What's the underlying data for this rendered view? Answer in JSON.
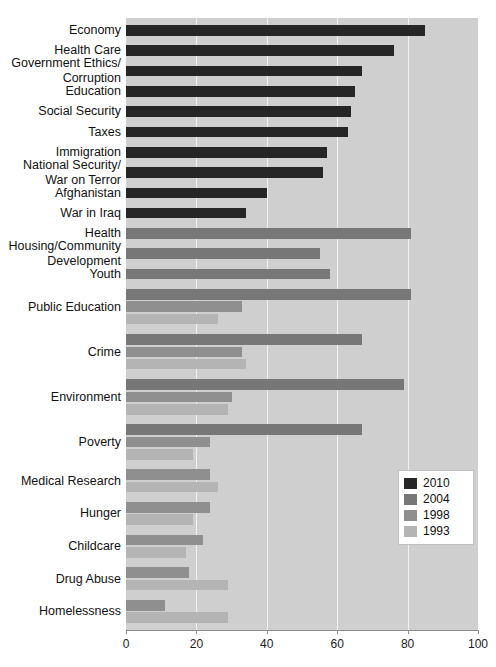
{
  "chart_data": {
    "type": "bar",
    "orientation": "horizontal",
    "title": "",
    "subtitle": "",
    "xlabel": "",
    "ylabel": "",
    "xlim": [
      0,
      100
    ],
    "xticks": [
      0,
      20,
      40,
      60,
      80,
      100
    ],
    "xtick_labels": [
      "0",
      "20",
      "40",
      "60",
      "80",
      "100"
    ],
    "grid": true,
    "grid_axis": "x",
    "legend_position": "center-right",
    "plot_background": "#cfcfcf",
    "series": [
      {
        "name": "2010",
        "color": "#262626"
      },
      {
        "name": "2004",
        "color": "#777777"
      },
      {
        "name": "1998",
        "color": "#8f8f8f"
      },
      {
        "name": "1993",
        "color": "#b4b4b4"
      }
    ],
    "categories": [
      "Economy",
      "Health Care",
      "Government Ethics/\nCorruption",
      "Education",
      "Social Security",
      "Taxes",
      "Immigration",
      "National Security/\nWar on Terror",
      "Afghanistan",
      "War in Iraq",
      "Health",
      "Housing/Community\nDevelopment",
      "Youth",
      "Public Education",
      "Crime",
      "Environment",
      "Poverty",
      "Medical Research",
      "Hunger",
      "Childcare",
      "Drug Abuse",
      "Homelessness"
    ],
    "groups": [
      {
        "category": "Economy",
        "bars": [
          {
            "series": "2010",
            "value": 85
          }
        ]
      },
      {
        "category": "Health Care",
        "bars": [
          {
            "series": "2010",
            "value": 76
          }
        ]
      },
      {
        "category": "Government Ethics/\nCorruption",
        "bars": [
          {
            "series": "2010",
            "value": 67
          }
        ]
      },
      {
        "category": "Education",
        "bars": [
          {
            "series": "2010",
            "value": 65
          }
        ]
      },
      {
        "category": "Social Security",
        "bars": [
          {
            "series": "2010",
            "value": 64
          }
        ]
      },
      {
        "category": "Taxes",
        "bars": [
          {
            "series": "2010",
            "value": 63
          }
        ]
      },
      {
        "category": "Immigration",
        "bars": [
          {
            "series": "2010",
            "value": 57
          }
        ]
      },
      {
        "category": "National Security/\nWar on Terror",
        "bars": [
          {
            "series": "2010",
            "value": 56
          }
        ]
      },
      {
        "category": "Afghanistan",
        "bars": [
          {
            "series": "2010",
            "value": 40
          }
        ]
      },
      {
        "category": "War in Iraq",
        "bars": [
          {
            "series": "2010",
            "value": 34
          }
        ]
      },
      {
        "category": "Health",
        "bars": [
          {
            "series": "2004",
            "value": 81
          }
        ]
      },
      {
        "category": "Housing/Community\nDevelopment",
        "bars": [
          {
            "series": "2004",
            "value": 55
          }
        ]
      },
      {
        "category": "Youth",
        "bars": [
          {
            "series": "2004",
            "value": 58
          }
        ]
      },
      {
        "category": "Public Education",
        "bars": [
          {
            "series": "2004",
            "value": 81
          },
          {
            "series": "1998",
            "value": 33
          },
          {
            "series": "1993",
            "value": 26
          }
        ]
      },
      {
        "category": "Crime",
        "bars": [
          {
            "series": "2004",
            "value": 67
          },
          {
            "series": "1998",
            "value": 33
          },
          {
            "series": "1993",
            "value": 34
          }
        ]
      },
      {
        "category": "Environment",
        "bars": [
          {
            "series": "2004",
            "value": 79
          },
          {
            "series": "1998",
            "value": 30
          },
          {
            "series": "1993",
            "value": 29
          }
        ]
      },
      {
        "category": "Poverty",
        "bars": [
          {
            "series": "2004",
            "value": 67
          },
          {
            "series": "1998",
            "value": 24
          },
          {
            "series": "1993",
            "value": 19
          }
        ]
      },
      {
        "category": "Medical Research",
        "bars": [
          {
            "series": "1998",
            "value": 24
          },
          {
            "series": "1993",
            "value": 26
          }
        ]
      },
      {
        "category": "Hunger",
        "bars": [
          {
            "series": "1998",
            "value": 24
          },
          {
            "series": "1993",
            "value": 19
          }
        ]
      },
      {
        "category": "Childcare",
        "bars": [
          {
            "series": "1998",
            "value": 22
          },
          {
            "series": "1993",
            "value": 17
          }
        ]
      },
      {
        "category": "Drug Abuse",
        "bars": [
          {
            "series": "1998",
            "value": 18
          },
          {
            "series": "1993",
            "value": 29
          }
        ]
      },
      {
        "category": "Homelessness",
        "bars": [
          {
            "series": "1998",
            "value": 11
          },
          {
            "series": "1993",
            "value": 29
          }
        ]
      }
    ]
  },
  "legend": {
    "items": [
      {
        "label": "2010",
        "color": "#262626"
      },
      {
        "label": "2004",
        "color": "#777777"
      },
      {
        "label": "1998",
        "color": "#8f8f8f"
      },
      {
        "label": "1993",
        "color": "#b4b4b4"
      }
    ]
  }
}
